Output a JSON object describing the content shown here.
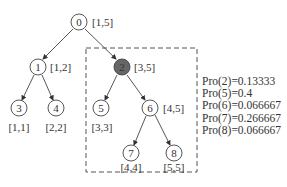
{
  "tree": {
    "nodes": [
      {
        "id": "0",
        "range": "[1,5]",
        "highlighted": false
      },
      {
        "id": "1",
        "range": "[1,2]",
        "highlighted": false
      },
      {
        "id": "2",
        "range": "[3,5]",
        "highlighted": true
      },
      {
        "id": "3",
        "range": "[1,1]",
        "highlighted": false
      },
      {
        "id": "4",
        "range": "[2,2]",
        "highlighted": false
      },
      {
        "id": "5",
        "range": "[3,3]",
        "highlighted": false
      },
      {
        "id": "6",
        "range": "[4,5]",
        "highlighted": false
      },
      {
        "id": "7",
        "range": "[4,4]",
        "highlighted": false
      },
      {
        "id": "8",
        "range": "[5,5]",
        "highlighted": false
      }
    ],
    "edges": [
      [
        "0",
        "1"
      ],
      [
        "0",
        "2"
      ],
      [
        "1",
        "3"
      ],
      [
        "1",
        "4"
      ],
      [
        "2",
        "5"
      ],
      [
        "2",
        "6"
      ],
      [
        "6",
        "7"
      ],
      [
        "6",
        "8"
      ]
    ],
    "highlight_color": "#666666",
    "subtree_box_root": "2"
  },
  "probabilities": [
    "Pro(2)=0.13333",
    "Pro(5)=0.4",
    "Pro(6)=0.066667",
    "Pro(7)=0.266667",
    "Pro(8)=0.066667"
  ]
}
